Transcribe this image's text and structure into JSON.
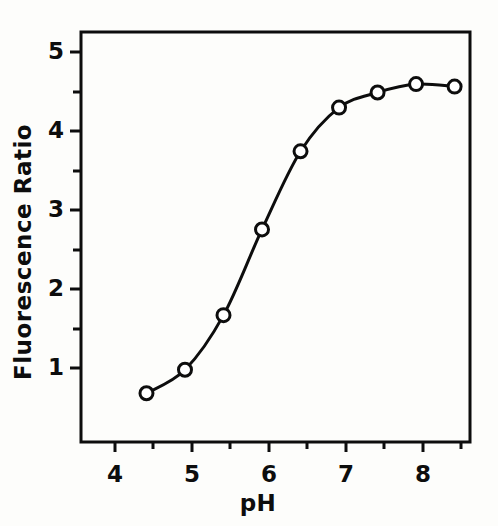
{
  "figure": {
    "background_color": "#fdfdfb",
    "ink_color": "#0d0d0d",
    "marker_fill": "#ffffff"
  },
  "chart_data": {
    "type": "line",
    "title": "",
    "subtitle": "",
    "xlabel": "pH",
    "ylabel": "Fluorescence  Ratio",
    "xlim": [
      3.65,
      8.7
    ],
    "ylim": [
      0.42,
      5.3
    ],
    "grid": false,
    "legend": null,
    "marker": "open-circle",
    "x": [
      4.5,
      5.0,
      5.5,
      6.0,
      6.5,
      7.0,
      7.5,
      8.0,
      8.5
    ],
    "values": [
      1.0,
      1.28,
      1.93,
      2.95,
      3.88,
      4.4,
      4.58,
      4.68,
      4.65
    ],
    "series": [
      {
        "name": "Fluorescence Ratio vs pH",
        "x": [
          4.5,
          5.0,
          5.5,
          6.0,
          6.5,
          7.0,
          7.5,
          8.0,
          8.5
        ],
        "values": [
          1.0,
          1.28,
          1.93,
          2.95,
          3.88,
          4.4,
          4.58,
          4.68,
          4.65
        ]
      }
    ],
    "x_axis": {
      "label": "pH",
      "major_ticks": [
        4,
        5,
        6,
        7,
        8
      ],
      "major_tick_labels": [
        "4",
        "5",
        "6",
        "7",
        "8"
      ],
      "minor_ticks": [
        4.5,
        5.5,
        6.5,
        7.5,
        8.5
      ],
      "tick_direction": "out"
    },
    "y_axis": {
      "label": "Fluorescence  Ratio",
      "major_ticks": [
        1,
        2,
        3,
        4,
        5
      ],
      "major_tick_labels": [
        "1",
        "2",
        "3",
        "4",
        "5"
      ],
      "minor_ticks": [
        1.5,
        2.5,
        3.5,
        4.5
      ],
      "tick_direction": "out"
    }
  }
}
